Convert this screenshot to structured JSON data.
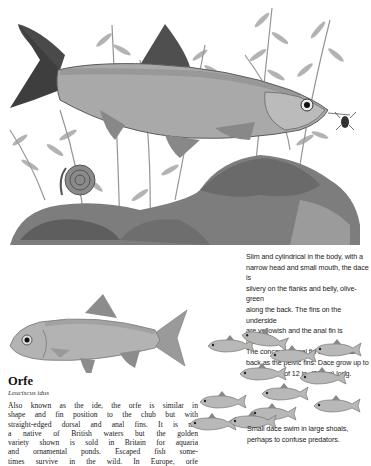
{
  "page": {
    "type": "illustrated-field-guide-page",
    "colors": {
      "background": "#ffffff",
      "text": "#1a1a1a",
      "illustration_gray": "#7a7a7a"
    }
  },
  "illustrations": {
    "dace_main": {
      "label": "Dace with water plants, snail and rocks",
      "icon": "fish-illustration"
    },
    "snail": {
      "label": "Ramshorn snail",
      "icon": "snail-illustration"
    },
    "insect": {
      "label": "Insect prey",
      "icon": "insect-illustration"
    },
    "orfe": {
      "label": "Orfe",
      "icon": "fish-illustration"
    },
    "shoal": {
      "label": "Shoal of small dace",
      "icon": "fish-shoal-illustration"
    }
  },
  "dace_caption": {
    "lines": [
      "Slim and cylindrical in the body, with a",
      "narrow head and small mouth, the dace is",
      "silvery on the flanks and belly, olive-green",
      "along the back. The fins on the underside",
      "are yellowish and the anal fin is concave.",
      "The concave dorsal fin arises as far",
      "back as the pelvic fins. Dace grow up to",
      "a maximum of 12 in. (30 cm) long."
    ]
  },
  "shoal_caption": {
    "lines": [
      "Small dace swim in large shoals,",
      "perhaps to confuse predators."
    ]
  },
  "orfe": {
    "title": "Orfe",
    "latin_name": "Leuciscus idus",
    "body_lines": [
      "Also known as the ide, the orfe is similar in",
      "shape and fin position to the chub but with",
      "straight-edged dorsal and anal fins. It is not",
      "a native of British waters but the golden",
      "variety shown is sold in Britain for aquaria",
      "and ornamental ponds. Escaped fish some-",
      "times survive in the wild. In Europe, orfe"
    ]
  }
}
